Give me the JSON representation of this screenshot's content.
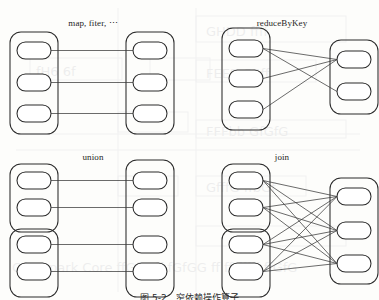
{
  "figure": {
    "title_caption": "图 5-2　窄依赖操作算子",
    "caption_clipped": true,
    "background_color": "#fdfdfb",
    "ink_color": "#2b2b2b",
    "media": "scanned book page",
    "panels": [
      {
        "id": "map-filter",
        "label": "map, fiter, ⋯",
        "label_x": 93,
        "label_y": 18,
        "dependency": "narrow",
        "source_groups": [
          {
            "partitions": 3
          }
        ],
        "target_groups": [
          {
            "partitions": 3
          }
        ],
        "edges": [
          {
            "from": 0,
            "to": 0
          },
          {
            "from": 1,
            "to": 1
          },
          {
            "from": 2,
            "to": 2
          }
        ]
      },
      {
        "id": "reduce-by-key",
        "label": "reduceByKey",
        "label_x": 282,
        "label_y": 18,
        "dependency": "wide",
        "source_groups": [
          {
            "partitions": 3
          }
        ],
        "target_groups": [
          {
            "partitions": 2
          }
        ],
        "edges": [
          {
            "from": 0,
            "to": 0
          },
          {
            "from": 0,
            "to": 1
          },
          {
            "from": 1,
            "to": 0
          },
          {
            "from": 2,
            "to": 0
          }
        ]
      },
      {
        "id": "union",
        "label": "union",
        "label_x": 93,
        "label_y": 152,
        "dependency": "narrow",
        "source_groups": [
          {
            "partitions": 2
          },
          {
            "partitions": 2
          }
        ],
        "target_groups": [
          {
            "partitions": 4
          }
        ],
        "edges": [
          {
            "from": 0,
            "to": 0
          },
          {
            "from": 1,
            "to": 1
          },
          {
            "from": 2,
            "to": 2
          },
          {
            "from": 3,
            "to": 3
          }
        ]
      },
      {
        "id": "join",
        "label": "join",
        "label_x": 282,
        "label_y": 152,
        "dependency": "wide",
        "source_groups": [
          {
            "partitions": 2
          },
          {
            "partitions": 2
          }
        ],
        "target_groups": [
          {
            "partitions": 3
          }
        ],
        "edges": [
          {
            "from": 0,
            "to": 0
          },
          {
            "from": 0,
            "to": 1
          },
          {
            "from": 0,
            "to": 2
          },
          {
            "from": 1,
            "to": 0
          },
          {
            "from": 1,
            "to": 1
          },
          {
            "from": 1,
            "to": 2
          },
          {
            "from": 2,
            "to": 0
          },
          {
            "from": 2,
            "to": 1
          },
          {
            "from": 2,
            "to": 2
          },
          {
            "from": 3,
            "to": 0
          },
          {
            "from": 3,
            "to": 1
          },
          {
            "from": 3,
            "to": 2
          }
        ]
      }
    ]
  }
}
